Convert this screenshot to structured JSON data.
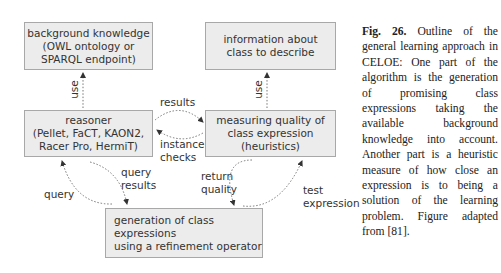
{
  "diagram": {
    "boxes": {
      "background": "background knowledge\n(OWL ontology or\nSPARQL endpoint)",
      "information": "information about\nclass to describe",
      "reasoner": "reasoner\n(Pellet, FaCT, KAON2,\nRacer Pro, HermiT)",
      "measuring": "measuring quality of\nclass expression\n(heuristics)",
      "generation": "generation of class expressions\nusing a refinement operator"
    },
    "edges": {
      "use_left": "use",
      "use_right": "use",
      "results": "results",
      "instance_checks": "instance\nchecks",
      "query": "query",
      "query_results": "query\nresults",
      "return_quality": "return\nquality",
      "test_expression": "test\nexpression"
    },
    "colors": {
      "box_fill": "#ececec",
      "box_border": "#a8a8a8",
      "text": "#333333",
      "arrow": "#444444"
    }
  },
  "caption": {
    "label": "Fig. 26.",
    "text": "Outline of the general learning approach in CELOE: One part of the algorithm is the generation of promising class expressions taking the available background knowledge into account. Another part is a heuristic measure of how close an expression is to being a solution of the learning problem. Figure adapted from [81]."
  }
}
